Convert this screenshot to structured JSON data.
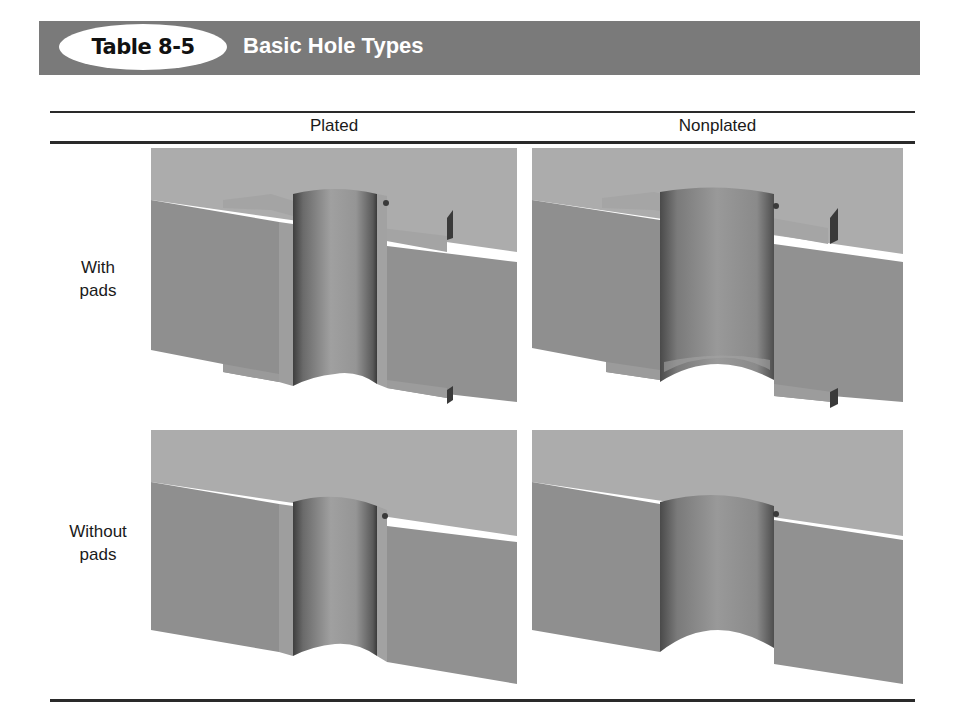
{
  "header": {
    "table_number": "Table 8-5",
    "title": "Basic Hole Types"
  },
  "table": {
    "columns": [
      {
        "label": "Plated"
      },
      {
        "label": "Nonplated"
      }
    ],
    "rows": [
      {
        "label_line1": "With",
        "label_line2": "pads",
        "cells": [
          {
            "figure": "plated-hole-with-pads-illustration"
          },
          {
            "figure": "nonplated-hole-with-pads-illustration"
          }
        ]
      },
      {
        "label_line1": "Without",
        "label_line2": "pads",
        "cells": [
          {
            "figure": "plated-hole-without-pads-illustration"
          },
          {
            "figure": "nonplated-hole-without-pads-illustration"
          }
        ]
      }
    ]
  },
  "colors": {
    "title_bar": "#7a7a7a",
    "top_face": "#a9a9a9",
    "front_face": "#8e8e8e",
    "hole_wall_light": "#9b9b9b",
    "hole_wall_dark": "#4a4a4a",
    "rule": "#2a2a2a"
  }
}
